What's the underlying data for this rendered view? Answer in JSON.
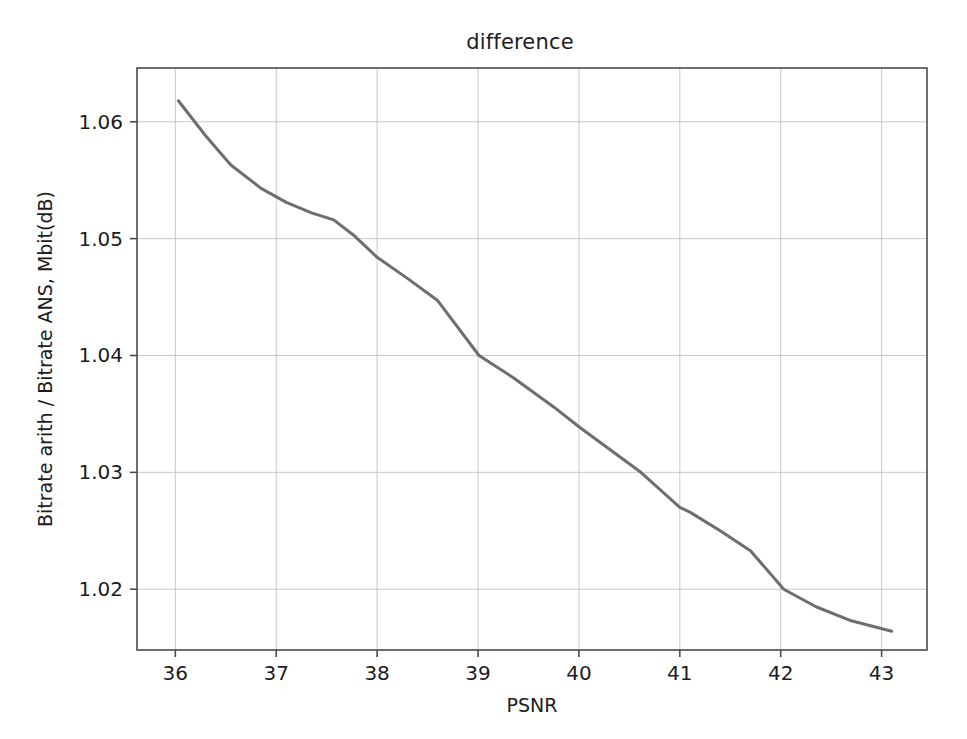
{
  "chart_data": {
    "type": "line",
    "title": "difference",
    "xlabel": "PSNR",
    "ylabel": "Bitrate arith / Bitrate ANS, Mbit(dB)",
    "xlim": [
      35.62,
      43.45
    ],
    "ylim": [
      1.0148,
      1.0646
    ],
    "xticks": [
      "36",
      "37",
      "38",
      "39",
      "40",
      "41",
      "42",
      "43"
    ],
    "xtick_values": [
      36,
      37,
      38,
      39,
      40,
      41,
      42,
      43
    ],
    "yticks": [
      "1.02",
      "1.03",
      "1.04",
      "1.05",
      "1.06"
    ],
    "ytick_values": [
      1.02,
      1.03,
      1.04,
      1.05,
      1.06
    ],
    "grid": true,
    "grid_color": "#b8b8b8",
    "legend": null,
    "series": [
      {
        "name": "difference",
        "color": "#6e6e6e",
        "linewidth": 3.0,
        "x": [
          36.03,
          36.3,
          36.55,
          36.85,
          37.1,
          37.35,
          37.57,
          37.78,
          38.0,
          38.3,
          38.6,
          39.01,
          39.35,
          39.75,
          40.0,
          40.3,
          40.6,
          41.0,
          41.1,
          41.4,
          41.7,
          42.03,
          42.35,
          42.7,
          43.1
        ],
        "y": [
          1.0618,
          1.0588,
          1.0563,
          1.0543,
          1.0531,
          1.0522,
          1.0516,
          1.0502,
          1.0484,
          1.0466,
          1.0447,
          1.04,
          1.0381,
          1.0356,
          1.0339,
          1.032,
          1.0301,
          1.027,
          1.0266,
          1.025,
          1.0233,
          1.02,
          1.0185,
          1.0173,
          1.0164
        ]
      }
    ]
  },
  "axes": {
    "spine_color": "#4a4a4a",
    "background": "#ffffff"
  }
}
